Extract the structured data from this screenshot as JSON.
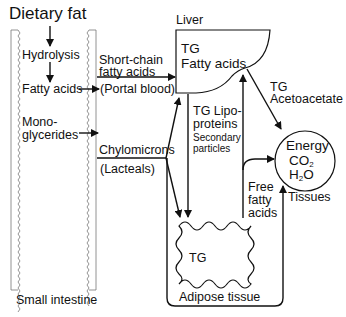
{
  "diagram": {
    "title": "Dietary fat",
    "intestine": {
      "label": "Small intestine",
      "steps": [
        "Hydrolysis",
        "Fatty acids",
        "Mono-",
        "glycerides"
      ]
    },
    "portal": {
      "label_line1": "Short-chain",
      "label_line2": "fatty acids",
      "route": "(Portal blood)"
    },
    "lymph": {
      "label": "Chylomicrons",
      "route": "(Lacteals)"
    },
    "liver": {
      "label": "Liver",
      "content_line1": "TG",
      "content_line2": "Fatty acids"
    },
    "liver_to_tissue": {
      "line1": "TG",
      "line2": "Acetoacetate"
    },
    "lipoproteins": {
      "line1": "TG Lipo-",
      "line2": "proteins",
      "sub1": "Secondary",
      "sub2": "particles"
    },
    "tissues": {
      "label": "Tissues",
      "line1": "Energy",
      "line2_base": "CO",
      "line2_sub": "2",
      "line3_pre": "H",
      "line3_sub": "2",
      "line3_post": "O"
    },
    "ffa": {
      "line1": "Free",
      "line2": "fatty",
      "line3": "acids"
    },
    "adipose": {
      "label": "Adipose tissue",
      "content": "TG"
    }
  }
}
